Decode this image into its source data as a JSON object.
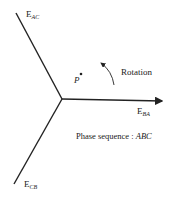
{
  "diagram": {
    "type": "phasor-diagram",
    "phasors": [
      {
        "name": "E",
        "subscript": "AC"
      },
      {
        "name": "E",
        "subscript": "BA"
      },
      {
        "name": "E",
        "subscript": "CB"
      }
    ],
    "point_label": "P",
    "rotation_label": "Rotation",
    "phase_sequence_label": "Phase sequence : ",
    "phase_sequence_value": "ABC",
    "colors": {
      "line": "#222222",
      "background": "#ffffff"
    }
  }
}
